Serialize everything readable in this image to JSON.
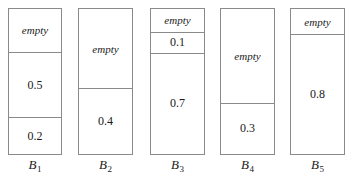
{
  "figure": {
    "type": "bin-packing-diagram",
    "empty_label": "empty",
    "bins": [
      {
        "id": "bin-1",
        "label_base": "B",
        "label_sub": "1",
        "x": 8,
        "y": 8,
        "width": 54,
        "height": 147,
        "label_x": 8,
        "label_y": 157,
        "segments": [
          {
            "kind": "empty",
            "text": "empty",
            "fraction": 0.3
          },
          {
            "kind": "value",
            "text": "0.5",
            "fraction": 0.45
          },
          {
            "kind": "value",
            "text": "0.2",
            "fraction": 0.25
          }
        ]
      },
      {
        "id": "bin-2",
        "label_base": "B",
        "label_sub": "2",
        "x": 78,
        "y": 8,
        "width": 55,
        "height": 147,
        "label_x": 78,
        "label_y": 157,
        "segments": [
          {
            "kind": "empty",
            "text": "empty",
            "fraction": 0.55
          },
          {
            "kind": "value",
            "text": "0.4",
            "fraction": 0.45
          }
        ]
      },
      {
        "id": "bin-3",
        "label_base": "B",
        "label_sub": "3",
        "x": 150,
        "y": 8,
        "width": 55,
        "height": 147,
        "label_x": 150,
        "label_y": 157,
        "segments": [
          {
            "kind": "empty",
            "text": "empty",
            "fraction": 0.16
          },
          {
            "kind": "value",
            "text": "0.1",
            "fraction": 0.14
          },
          {
            "kind": "value",
            "text": "0.7",
            "fraction": 0.7
          }
        ]
      },
      {
        "id": "bin-4",
        "label_base": "B",
        "label_sub": "4",
        "x": 220,
        "y": 8,
        "width": 55,
        "height": 147,
        "label_x": 220,
        "label_y": 157,
        "segments": [
          {
            "kind": "empty",
            "text": "empty",
            "fraction": 0.65
          },
          {
            "kind": "value",
            "text": "0.3",
            "fraction": 0.35
          }
        ]
      },
      {
        "id": "bin-5",
        "label_base": "B",
        "label_sub": "5",
        "x": 290,
        "y": 8,
        "width": 55,
        "height": 147,
        "label_x": 290,
        "label_y": 157,
        "segments": [
          {
            "kind": "empty",
            "text": "empty",
            "fraction": 0.175
          },
          {
            "kind": "value",
            "text": "0.8",
            "fraction": 0.825
          }
        ]
      }
    ],
    "colors": {
      "border": "#8a8a8a",
      "fill": "#ffffff",
      "text": "#1a1a1a"
    }
  }
}
